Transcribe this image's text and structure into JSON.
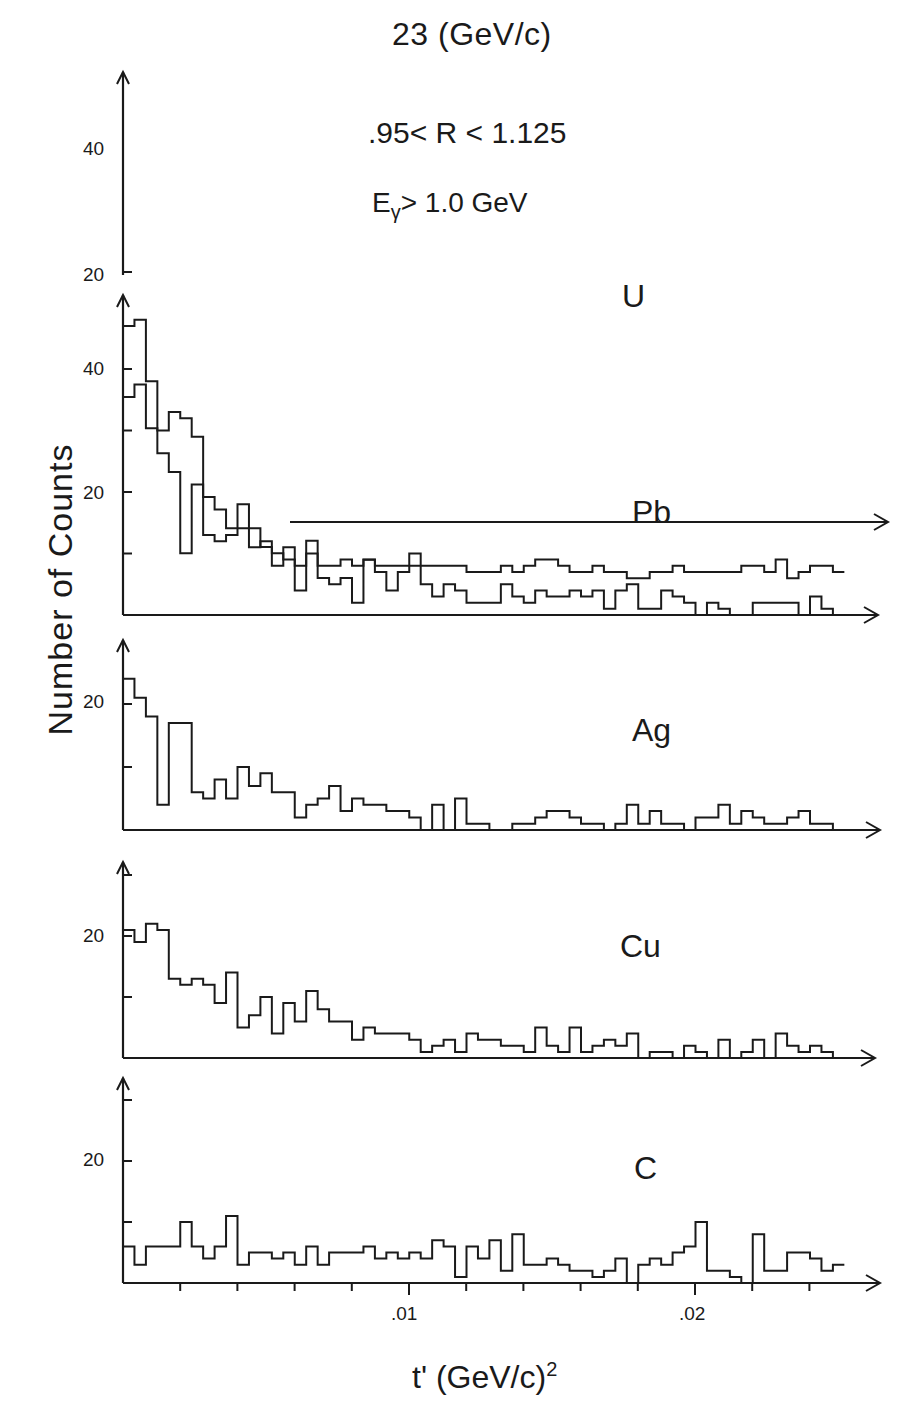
{
  "figure": {
    "title": "23 (GeV/c)",
    "cut_r": ".95< R < 1.125",
    "cut_e_main": "E",
    "cut_e_sub": "γ",
    "cut_e_rest": "> 1.0 GeV",
    "ylabel": "Number of Counts",
    "xlabel_main": "t'  (GeV/c)",
    "xlabel_sup": "2",
    "x_ticks": [
      ".01",
      ".02"
    ],
    "line_color": "#1a1a1a",
    "background": "#ffffff"
  },
  "panels": [
    {
      "label": "U",
      "yticks": [
        "40",
        "20"
      ]
    },
    {
      "label": "Pb",
      "yticks": [
        "40",
        "20"
      ]
    },
    {
      "label": "Ag",
      "yticks": [
        "20"
      ]
    },
    {
      "label": "Cu",
      "yticks": [
        "20"
      ]
    },
    {
      "label": "C",
      "yticks": [
        "20"
      ]
    }
  ],
  "chart_data": {
    "type": "bar",
    "xlabel": "t' (GeV/c)^2",
    "ylabel": "Number of Counts",
    "x_bin_width": 0.0004,
    "x_range": [
      0,
      0.0262
    ],
    "x_tick_labels": [
      ".01",
      ".02"
    ],
    "grid": false,
    "legend": "panel labels U, Pb, Ag, Cu, C",
    "series": [
      {
        "name": "U",
        "note": "offset histogram, baseline 20 on shared axis; tail continues above Pb panel",
        "values": [
          40,
          42,
          35,
          31,
          28,
          15,
          26,
          24,
          22,
          19,
          19,
          19,
          16,
          15,
          14,
          13,
          17,
          13,
          13,
          14,
          13,
          14,
          13,
          13,
          13,
          13,
          13,
          13,
          13,
          13,
          12,
          12,
          12,
          13,
          12,
          13,
          14,
          14,
          13,
          12,
          12,
          13,
          12,
          12,
          11,
          11,
          12,
          12,
          13,
          12,
          12,
          12,
          12,
          12,
          13,
          13,
          12,
          14,
          11,
          12,
          13,
          13,
          12
        ]
      },
      {
        "name": "Pb",
        "values": [
          47,
          48,
          38,
          30,
          33,
          32,
          29,
          13,
          12,
          13,
          18,
          11,
          12,
          8,
          11,
          4,
          10,
          6,
          5,
          6,
          2,
          9,
          7,
          4,
          7,
          10,
          5,
          3,
          5,
          4,
          2,
          2,
          2,
          5,
          3,
          2,
          4,
          3,
          3,
          4,
          3,
          4,
          1,
          4,
          5,
          1,
          1,
          4,
          3,
          2,
          0,
          2,
          1,
          0,
          0,
          2,
          2,
          2,
          2,
          0,
          3,
          1,
          0
        ]
      },
      {
        "name": "Ag",
        "values": [
          24,
          21,
          18,
          4,
          17,
          17,
          6,
          5,
          8,
          5,
          10,
          7,
          9,
          6,
          6,
          2,
          4,
          5,
          7,
          3,
          5,
          4,
          4,
          3,
          3,
          2,
          0,
          4,
          0,
          5,
          1,
          1,
          0,
          0,
          1,
          1,
          2,
          3,
          3,
          2,
          1,
          1,
          0,
          1,
          4,
          1,
          3,
          1,
          1,
          0,
          2,
          2,
          4,
          1,
          3,
          2,
          1,
          1,
          2,
          3,
          1,
          1,
          0
        ]
      },
      {
        "name": "Cu",
        "values": [
          21,
          19,
          22,
          21,
          13,
          12,
          13,
          12,
          9,
          14,
          5,
          7,
          10,
          4,
          9,
          6,
          11,
          8,
          6,
          6,
          3,
          5,
          4,
          4,
          4,
          3,
          1,
          2,
          3,
          1,
          4,
          3,
          3,
          2,
          2,
          1,
          5,
          2,
          1,
          5,
          1,
          2,
          3,
          2,
          4,
          0,
          1,
          1,
          0,
          2,
          1,
          0,
          3,
          0,
          1,
          3,
          0,
          4,
          2,
          1,
          2,
          1,
          0
        ]
      },
      {
        "name": "C",
        "values": [
          6,
          3,
          6,
          6,
          6,
          10,
          6,
          4,
          6,
          11,
          3,
          5,
          5,
          4,
          5,
          3,
          6,
          3,
          5,
          5,
          5,
          6,
          4,
          5,
          4,
          5,
          4,
          7,
          6,
          1,
          6,
          4,
          7,
          2,
          8,
          3,
          3,
          4,
          3,
          2,
          2,
          1,
          2,
          4,
          0,
          3,
          4,
          3,
          5,
          6,
          10,
          2,
          2,
          1,
          0,
          8,
          2,
          2,
          5,
          5,
          4,
          2,
          3
        ]
      }
    ]
  }
}
